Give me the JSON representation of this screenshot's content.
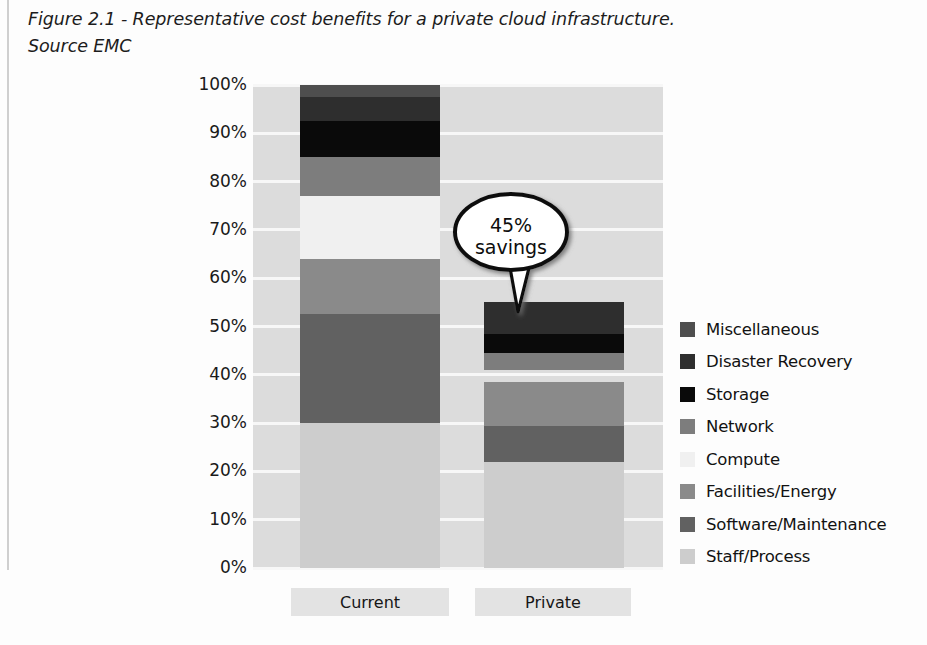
{
  "caption": {
    "line1": "Figure 2.1 - Representative cost benefits for a private cloud infrastructure.",
    "line2": "Source EMC"
  },
  "chart_data": {
    "type": "bar",
    "subtype": "stacked-100-percent",
    "title": "",
    "xlabel": "",
    "ylabel": "",
    "categories": [
      "Current",
      "Private"
    ],
    "ylim": [
      0,
      100
    ],
    "ytick_labels": [
      "0%",
      "10%",
      "20%",
      "30%",
      "40%",
      "50%",
      "60%",
      "70%",
      "80%",
      "90%",
      "100%"
    ],
    "ytick_values": [
      0,
      10,
      20,
      30,
      40,
      50,
      60,
      70,
      80,
      90,
      100
    ],
    "grid": true,
    "legend_position": "right",
    "series": [
      {
        "name": "Miscellaneous",
        "color": "#4e4e4e",
        "values": [
          2.5,
          0
        ]
      },
      {
        "name": "Disaster Recovery",
        "color": "#2e2e2e",
        "values": [
          5.0,
          6.5
        ]
      },
      {
        "name": "Storage",
        "color": "#0a0a0a",
        "values": [
          7.5,
          4.0
        ]
      },
      {
        "name": "Network",
        "color": "#7d7d7d",
        "values": [
          8.0,
          3.5
        ]
      },
      {
        "name": "Compute",
        "color": "#f0f0f0",
        "values": [
          13.0,
          0
        ]
      },
      {
        "name": "Facilities/Energy",
        "color": "#8a8a8a",
        "values": [
          11.5,
          9.0
        ]
      },
      {
        "name": "Software/Maintenance",
        "color": "#616161",
        "values": [
          22.5,
          9.0
        ]
      },
      {
        "name": "Staff/Process",
        "color": "#cdcdcd",
        "values": [
          30.0,
          22.0
        ]
      }
    ],
    "stack_tops": {
      "Current": [
        100.0,
        97.5,
        92.5,
        85.0,
        77.0,
        64.0,
        52.5,
        30.0
      ],
      "Private": [
        55.0,
        55.0,
        48.5,
        44.5,
        38.5,
        38.5,
        29.5,
        22.0
      ]
    },
    "annotations": [
      {
        "name": "savings-callout",
        "line1": "45%",
        "line2": "savings",
        "target": "Private"
      }
    ]
  },
  "style": {
    "plot_background": "#dcdcdc",
    "gridline_color": "#f7f7f7",
    "page_background": "#fdfdfd",
    "text_color": "#1a1a1a",
    "xlabel_background": "#e3e3e3"
  }
}
